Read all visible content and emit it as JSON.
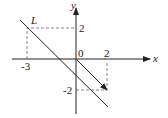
{
  "diagram": {
    "axes": {
      "x_label": "x",
      "y_label": "y",
      "origin_label": "0"
    },
    "line_label": "L",
    "ticks": {
      "x_neg": "-3",
      "x_pos": "2",
      "y_pos": "2",
      "y_neg": "-2"
    },
    "elements": [
      {
        "type": "line",
        "name": "L",
        "through": [
          [
            -3,
            2
          ],
          [
            0,
            -1
          ]
        ]
      },
      {
        "type": "vector",
        "from": [
          0,
          0
        ],
        "to": [
          2,
          -2
        ]
      },
      {
        "type": "dashed",
        "points": [
          [
            -3,
            0
          ],
          [
            -3,
            2
          ],
          [
            0,
            2
          ]
        ]
      },
      {
        "type": "dashed",
        "points": [
          [
            2,
            0
          ],
          [
            2,
            -2
          ],
          [
            0,
            -2
          ]
        ]
      }
    ]
  }
}
